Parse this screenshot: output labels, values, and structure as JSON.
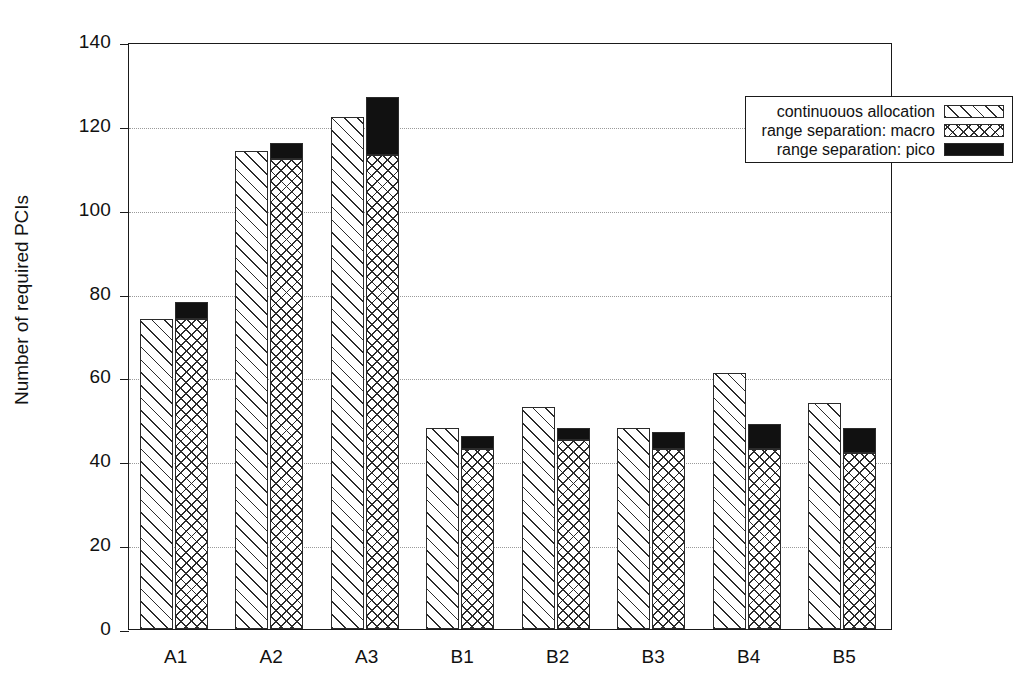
{
  "chart_data": {
    "type": "bar",
    "title": "",
    "xlabel": "",
    "ylabel": "Number of required PCIs",
    "ylim": [
      0,
      140
    ],
    "yticks": [
      0,
      20,
      40,
      60,
      80,
      100,
      120,
      140
    ],
    "grid": true,
    "legend_position": "top-right",
    "categories": [
      "A1",
      "A2",
      "A3",
      "B1",
      "B2",
      "B3",
      "B4",
      "B5"
    ],
    "series": [
      {
        "name": "continuouos allocation",
        "fill": "diagonal-hatch",
        "values": [
          74,
          114,
          122,
          48,
          53,
          48,
          61,
          54
        ]
      },
      {
        "name": "range separation: macro",
        "fill": "cross-hatch",
        "values": [
          74,
          112,
          113,
          43,
          45,
          43,
          43,
          42
        ]
      },
      {
        "name": "range separation: pico",
        "fill": "solid-black",
        "stacked_on": "range separation: macro",
        "totals": [
          78,
          116,
          127,
          46,
          48,
          47,
          49,
          48
        ],
        "values": [
          4,
          4,
          14,
          3,
          3,
          4,
          6,
          6
        ]
      }
    ]
  },
  "axis": {
    "y_title": "Number of required PCIs",
    "y_tick_labels": [
      "0",
      "20",
      "40",
      "60",
      "80",
      "100",
      "120",
      "140"
    ],
    "x_tick_labels": [
      "A1",
      "A2",
      "A3",
      "B1",
      "B2",
      "B3",
      "B4",
      "B5"
    ]
  },
  "legend": {
    "entries": [
      {
        "label": "continuouos allocation",
        "swatch": "diagonal-hatch-swatch"
      },
      {
        "label": "range separation: macro",
        "swatch": "cross-hatch-swatch"
      },
      {
        "label": "range separation: pico",
        "swatch": "solid-black-swatch"
      }
    ]
  },
  "colors": {
    "ink": "#1a1a1a",
    "hatch": "#2b2b2b",
    "pico": "#111111",
    "grid": "#9a9a9a",
    "background": "#ffffff"
  }
}
